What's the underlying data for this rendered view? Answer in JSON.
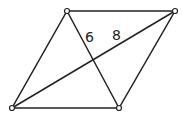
{
  "diagram": {
    "type": "parallelogram with diagonals",
    "vertices": [
      {
        "id": "top-left",
        "x": 67,
        "y": 11
      },
      {
        "id": "top-right",
        "x": 175,
        "y": 11
      },
      {
        "id": "bottom-right",
        "x": 119,
        "y": 108
      },
      {
        "id": "bottom-left",
        "x": 12,
        "y": 108
      }
    ],
    "labels": {
      "short_segment": "6",
      "long_segment": "8"
    },
    "colors": {
      "stroke": "#222222",
      "background": "#ffffff"
    }
  }
}
